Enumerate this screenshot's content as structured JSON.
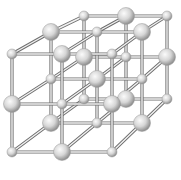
{
  "figure": {
    "title": "",
    "grid_size": [
      3,
      3,
      3
    ],
    "colors": {
      "background": "#ffffff",
      "bond_outer": "#6e6e6e",
      "bond_inner": "#f2f2f2",
      "sphere_light": "#fafafa",
      "sphere_mid": "#d4d4d4",
      "sphere_dark": "#8c8c8c"
    },
    "sphere_radius": {
      "large": 8.5,
      "small": 5
    },
    "layers": [
      {
        "name": "back",
        "x": [
          84,
          126,
          167
        ],
        "y": [
          16,
          57,
          99
        ]
      },
      {
        "name": "middle",
        "x": [
          51,
          97,
          142
        ],
        "y": [
          32,
          79,
          123
        ]
      },
      {
        "name": "front",
        "x": [
          12,
          62,
          112
        ],
        "y": [
          54,
          104,
          152
        ]
      }
    ]
  }
}
